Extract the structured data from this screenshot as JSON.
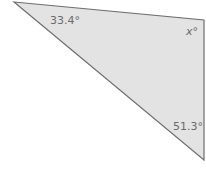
{
  "diagram": {
    "type": "triangle",
    "fill_color": "#e3e3e3",
    "stroke_color": "#6e6e6e",
    "vertices": {
      "top_left": [
        14,
        2
      ],
      "top_right": [
        204,
        20
      ],
      "bottom_right": [
        204,
        160
      ]
    },
    "angles": {
      "top_left": "33.4°",
      "top_right": "x°",
      "bottom_right": "51.3°"
    }
  }
}
